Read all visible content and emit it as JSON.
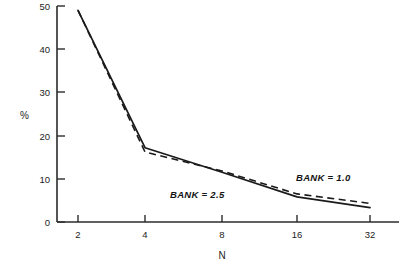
{
  "chart_data": {
    "type": "line",
    "title": "",
    "subtitle": "",
    "xlabel": "N",
    "ylabel": "%",
    "x": [
      2,
      4,
      8,
      16,
      32
    ],
    "xticklabels": [
      "2",
      "4",
      "8",
      "16",
      "32"
    ],
    "xscale": "log2-equal-spacing",
    "ylim": [
      0,
      50
    ],
    "yticks": [
      0,
      10,
      20,
      30,
      40,
      50
    ],
    "yticklabels": [
      "0",
      "10",
      "20",
      "30",
      "40",
      "50"
    ],
    "grid": false,
    "legend_position": "inline-annotations",
    "series": [
      {
        "name": "BANK = 2.5",
        "style": "solid",
        "color": "#1a1a1a",
        "values": [
          49.0,
          17.2,
          11.5,
          5.8,
          3.3
        ]
      },
      {
        "name": "BANK = 1.0",
        "style": "dashed",
        "color": "#1a1a1a",
        "values": [
          49.0,
          16.2,
          11.8,
          6.5,
          4.3
        ]
      }
    ],
    "annotations": [
      {
        "text": "BANK = 2.5",
        "x": 5.4,
        "y": 8.5
      },
      {
        "text": "BANK = 1.0",
        "x": 15.0,
        "y": 13.0
      }
    ]
  },
  "axes": {
    "y_title": "%",
    "x_title": "N",
    "y_tick_0": "0",
    "y_tick_10": "10",
    "y_tick_20": "20",
    "y_tick_30": "30",
    "y_tick_40": "40",
    "y_tick_50": "50",
    "x_tick_2": "2",
    "x_tick_4": "4",
    "x_tick_8": "8",
    "x_tick_16": "16",
    "x_tick_32": "32"
  },
  "annotations": {
    "bank_25": "BANK = 2.5",
    "bank_10": "BANK = 1.0"
  }
}
